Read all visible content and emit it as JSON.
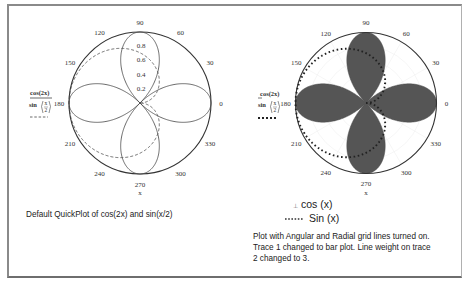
{
  "chart_data": [
    {
      "type": "polar-line",
      "title": "",
      "xlabel": "x",
      "angle_ticks": [
        "0",
        "30",
        "60",
        "90",
        "120",
        "150",
        "180",
        "210",
        "240",
        "270",
        "300",
        "330"
      ],
      "radial_ticks": [
        "0.2",
        "0.4",
        "0.6",
        "0.8"
      ],
      "rlim": [
        0,
        1
      ],
      "grid": false,
      "series": [
        {
          "name": "cos(2x)",
          "expr": "cos(2x)",
          "style": "solid",
          "line_weight": 1
        },
        {
          "name": "sin(x/2)",
          "expr": "sin(x/2)",
          "style": "dashed",
          "line_weight": 1
        }
      ],
      "legend": {
        "position": "left",
        "entries": [
          "cos(2x)",
          "sin(x/2)"
        ]
      }
    },
    {
      "type": "polar-bar",
      "title": "",
      "xlabel": "x",
      "angle_ticks": [
        "0",
        "30",
        "60",
        "90",
        "120",
        "150",
        "180",
        "210",
        "240",
        "270",
        "300",
        "330"
      ],
      "rlim": [
        0,
        1
      ],
      "grid": true,
      "series": [
        {
          "name": "cos(2x)",
          "expr": "cos(2x)",
          "style": "bar",
          "color": "#555555"
        },
        {
          "name": "sin(x/2)",
          "expr": "sin(x/2)",
          "style": "dotted",
          "line_weight": 3
        }
      ],
      "legend": {
        "position": "left",
        "entries": [
          "cos(2x)",
          "sin(x/2)"
        ]
      }
    }
  ],
  "left_panel": {
    "legend_trace1": "cos(2x)",
    "legend_trace2_fn": "sin",
    "legend_trace2_num": "x",
    "legend_trace2_den": "2",
    "x_label": "x",
    "caption": "Default QuickPlot of cos(2x) and sin(x/2)"
  },
  "right_panel": {
    "legend_trace1": "cos(2x)",
    "legend_trace2_fn": "sin",
    "legend_trace2_num": "x",
    "legend_trace2_den": "2",
    "x_label": "x",
    "key_trace1": "cos (x)",
    "key_trace2": "Sin (x)",
    "caption_lines": [
      "Plot with Angular and Radial grid lines turned on.",
      "Trace 1 changed to bar plot. Line weight on trace",
      "2 changed to 3."
    ]
  },
  "colors": {
    "frame": "#8a8a8a",
    "axis": "#444444",
    "bar_fill": "#555555",
    "trace": "#333333"
  }
}
